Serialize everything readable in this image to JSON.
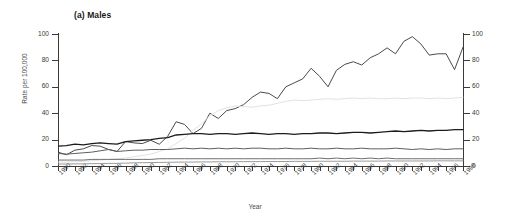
{
  "chart_data": {
    "type": "line",
    "title": "(a) Males",
    "xlabel": "Year",
    "ylabel": "Rate per 100,000",
    "ylabel_right": "",
    "xlim": [
      1950,
      1998
    ],
    "ylim": [
      0,
      100
    ],
    "yticks": [
      0,
      20,
      40,
      60,
      80,
      100
    ],
    "ytick_labels_left": [
      "0",
      "20",
      "40",
      "60",
      "80",
      "100"
    ],
    "ytick_labels_right": [
      "0",
      "20",
      "40",
      "60",
      "80",
      "100"
    ],
    "grid": false,
    "legend": "none",
    "x": [
      1950,
      1951,
      1952,
      1953,
      1954,
      1955,
      1956,
      1957,
      1958,
      1959,
      1960,
      1961,
      1962,
      1963,
      1964,
      1965,
      1966,
      1967,
      1968,
      1969,
      1970,
      1971,
      1972,
      1973,
      1974,
      1975,
      1976,
      1977,
      1978,
      1979,
      1980,
      1981,
      1982,
      1983,
      1984,
      1985,
      1986,
      1987,
      1988,
      1989,
      1990,
      1991,
      1992,
      1993,
      1994,
      1995,
      1996,
      1997,
      1998
    ],
    "xtick_labels": [
      "1950",
      "1952",
      "1954",
      "1956",
      "1958",
      "1960",
      "1962",
      "1964",
      "1966",
      "1968",
      "1970",
      "1972",
      "1974",
      "1976",
      "1978",
      "1980",
      "1982",
      "1984",
      "1986",
      "1988",
      "1990",
      "1992",
      "1994",
      "1996",
      "1998"
    ],
    "series": [
      {
        "name": "series-1-lung",
        "color": "#4a4a4a",
        "width": 1.0,
        "values": [
          10.5,
          8.5,
          12.0,
          13.0,
          15.5,
          15.0,
          12.5,
          11.0,
          18.5,
          17.5,
          17.0,
          19.5,
          16.5,
          22.5,
          33.5,
          31.5,
          24.5,
          28.5,
          40.0,
          36.0,
          42.0,
          43.5,
          46.5,
          52.0,
          56.0,
          55.0,
          51.0,
          60.0,
          63.0,
          66.0,
          74.0,
          68.0,
          60.0,
          72.5,
          77.0,
          79.0,
          76.5,
          82.0,
          85.0,
          89.5,
          85.0,
          94.5,
          98.0,
          92.5,
          84.0,
          85.0,
          85.0,
          73.0,
          90.0
        ]
      },
      {
        "name": "series-2-lightest",
        "color": "#e2e2e2",
        "width": 1.0,
        "values": [
          3.0,
          3.0,
          3.2,
          3.5,
          4.0,
          4.5,
          5.0,
          5.5,
          6.0,
          7.0,
          8.0,
          9.0,
          11.0,
          13.0,
          17.0,
          21.0,
          27.0,
          32.0,
          38.0,
          42.0,
          44.0,
          45.5,
          45.0,
          44.5,
          45.5,
          46.0,
          47.5,
          49.0,
          50.0,
          49.5,
          50.0,
          50.5,
          51.0,
          50.5,
          51.0,
          51.5,
          51.0,
          51.5,
          51.0,
          51.0,
          51.5,
          51.0,
          51.5,
          51.5,
          51.0,
          51.5,
          51.0,
          51.5,
          52.0
        ]
      },
      {
        "name": "series-3-dark",
        "color": "#1c1c1c",
        "width": 1.3,
        "values": [
          15.0,
          15.5,
          16.5,
          16.0,
          17.0,
          17.5,
          17.0,
          16.5,
          18.5,
          19.0,
          19.5,
          20.0,
          21.0,
          21.5,
          23.5,
          24.0,
          24.5,
          24.5,
          24.0,
          24.5,
          24.5,
          24.0,
          24.5,
          25.0,
          24.5,
          24.0,
          24.5,
          24.5,
          24.0,
          24.5,
          24.5,
          25.0,
          25.0,
          24.5,
          25.0,
          25.5,
          25.5,
          25.0,
          25.5,
          26.0,
          26.5,
          26.0,
          26.5,
          27.0,
          26.5,
          27.0,
          27.0,
          27.5,
          27.5
        ]
      },
      {
        "name": "series-4-mid-gray",
        "color": "#5e5e5e",
        "width": 1.0,
        "values": [
          9.5,
          9.0,
          9.5,
          10.0,
          10.5,
          11.5,
          12.5,
          11.0,
          11.5,
          12.0,
          12.0,
          12.5,
          12.5,
          12.5,
          13.0,
          13.5,
          13.0,
          13.5,
          13.0,
          13.5,
          13.0,
          13.5,
          13.0,
          13.5,
          13.5,
          13.0,
          13.0,
          13.5,
          13.0,
          13.0,
          13.5,
          13.0,
          13.0,
          13.5,
          13.0,
          13.0,
          13.5,
          13.0,
          13.0,
          13.0,
          13.5,
          13.0,
          12.5,
          13.0,
          12.5,
          13.0,
          12.5,
          13.0,
          13.0
        ]
      },
      {
        "name": "series-5-low-gray",
        "color": "#6f6f6f",
        "width": 1.0,
        "values": [
          4.5,
          4.5,
          4.5,
          4.5,
          5.0,
          5.0,
          5.0,
          5.0,
          5.0,
          5.0,
          5.0,
          5.0,
          5.5,
          5.5,
          5.5,
          5.5,
          5.5,
          5.5,
          5.5,
          5.5,
          5.5,
          5.5,
          5.5,
          5.5,
          5.5,
          5.5,
          5.5,
          5.5,
          5.5,
          5.5,
          5.5,
          6.0,
          5.5,
          6.0,
          5.5,
          6.0,
          5.5,
          6.0,
          5.5,
          6.0,
          5.5,
          5.5,
          5.5,
          5.5,
          5.5,
          5.5,
          5.5,
          5.5,
          5.5
        ]
      },
      {
        "name": "series-6-bottom",
        "color": "#9a9a9a",
        "width": 1.0,
        "values": [
          1.5,
          1.5,
          1.6,
          1.6,
          1.8,
          1.8,
          2.0,
          2.0,
          2.2,
          2.4,
          2.5,
          2.6,
          2.7,
          2.8,
          2.9,
          3.0,
          3.0,
          3.1,
          3.1,
          3.2,
          3.2,
          3.2,
          3.3,
          3.3,
          3.3,
          3.4,
          3.4,
          3.4,
          3.5,
          3.5,
          3.5,
          3.6,
          3.6,
          3.6,
          3.6,
          3.7,
          3.7,
          3.7,
          3.7,
          3.8,
          3.8,
          3.8,
          3.8,
          3.8,
          3.8,
          3.9,
          3.9,
          3.9,
          3.9
        ]
      }
    ]
  }
}
